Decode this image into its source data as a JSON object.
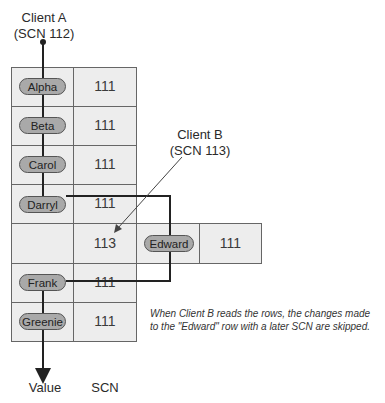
{
  "client_a": {
    "line1": "Client A",
    "line2": "(SCN 112)"
  },
  "client_b": {
    "line1": "Client B",
    "line2": "(SCN 113)"
  },
  "rows": [
    {
      "value": "Alpha",
      "scn": "111",
      "struck": false
    },
    {
      "value": "Beta",
      "scn": "111",
      "struck": false
    },
    {
      "value": "Carol",
      "scn": "111",
      "struck": false
    },
    {
      "value": "Darryl",
      "scn": "111",
      "struck": true
    },
    {
      "value": "",
      "scn": "113",
      "struck": false
    },
    {
      "value": "Frank",
      "scn": "111",
      "struck": true
    },
    {
      "value": "Greenie",
      "scn": "111",
      "struck": false
    }
  ],
  "edward_row": {
    "value": "Edward",
    "scn": "111"
  },
  "axis_labels": {
    "value": "Value",
    "scn": "SCN"
  },
  "note": {
    "line1": "When Client B reads the rows, the changes made",
    "line2": "to the \"Edward\" row with a later SCN are skipped."
  },
  "colors": {
    "cell": "#ededed",
    "pill": "#a9a9a9",
    "line": "#222222",
    "border": "#666666"
  }
}
